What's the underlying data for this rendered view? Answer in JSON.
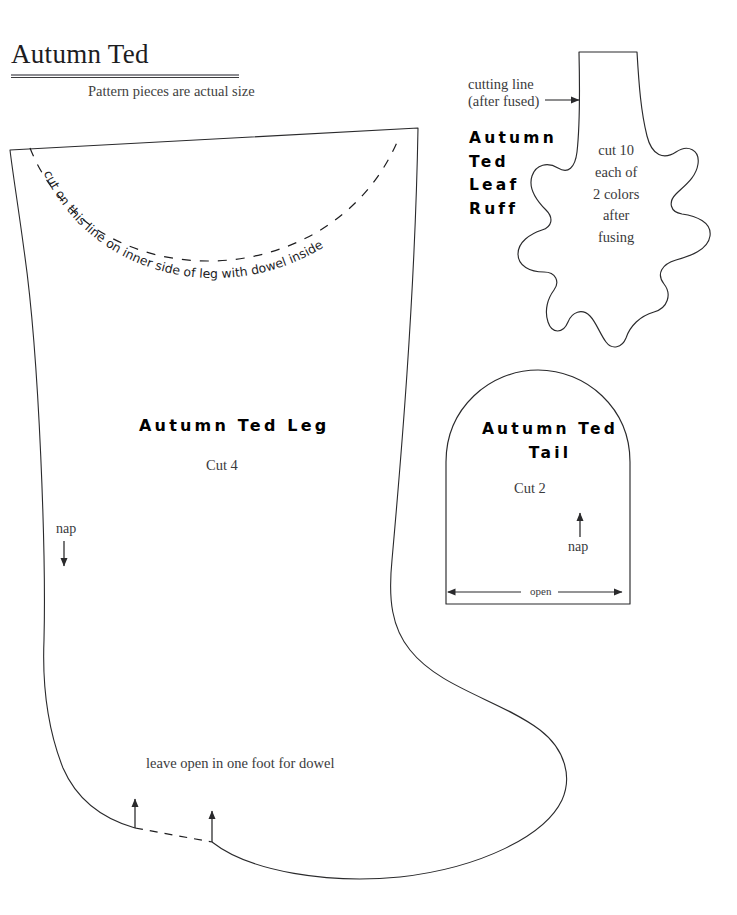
{
  "document": {
    "title": "Autumn Ted",
    "subtitle": "Pattern pieces are actual size",
    "type": "sewing-pattern-sheet"
  },
  "pieces": {
    "leg": {
      "name": "Autumn Ted Leg",
      "cut_count_label": "Cut 4",
      "nap_label": "nap",
      "nap_direction": "down",
      "dashed_curve_label": "cut on this line on inner side of leg with dowel inside",
      "foot_note": "leave open in one foot for dowel"
    },
    "tail": {
      "name_line_1": "Autumn Ted",
      "name_line_2": "Tail",
      "cut_count_label": "Cut 2",
      "nap_label": "nap",
      "nap_direction": "up",
      "open_label": "open"
    },
    "leaf_ruff": {
      "name_lines": "Autumn\nTed\nLeaf\nRuff",
      "cutting_line_label": "cutting line\n(after fused)",
      "instruction": "cut 10\neach of\n2 colors\nafter\nfusing"
    }
  },
  "colors": {
    "ink": "#231f20",
    "outline": "#2a2a2c",
    "rule_thick": "#8d8d92",
    "rule_thin": "#3b3b3d",
    "paper": "#ffffff"
  }
}
